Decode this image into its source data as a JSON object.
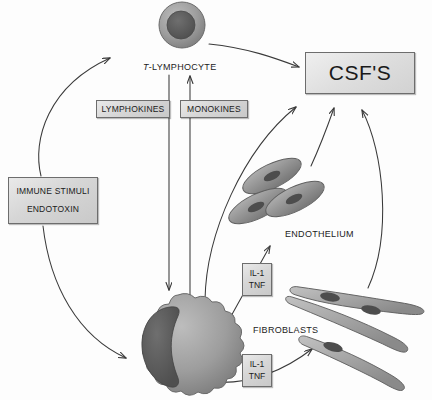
{
  "diagram": {
    "background_color": "#fdfdfd",
    "stroke_color": "#3a3a3a",
    "box_fill": "#d8d8d8",
    "box_border": "#6d6d6d",
    "cell_fill": "#9a9a9a",
    "nucleus_fill": "#5e5e5e"
  },
  "boxes": {
    "csf": "CSF'S",
    "lymphokines": "LYMPHOKINES",
    "monokines": "MONOKINES",
    "stimuli_line1": "IMMUNE STIMULI",
    "stimuli_line2": "ENDOTOXIN",
    "il1_top_line1": "IL-1",
    "il1_top_line2": "TNF",
    "il1_bottom_line1": "IL-1",
    "il1_bottom_line2": "TNF"
  },
  "labels": {
    "t_lymphocyte_prefix": "T",
    "t_lymphocyte_rest": "-LYMPHOCYTE",
    "endothelium": "ENDOTHELIUM",
    "fibroblasts": "FIBROBLASTS"
  },
  "cells": {
    "t_lymphocyte": "round lymphocyte with large nucleus",
    "macrophage": "ruffled macrophage with crescent nucleus",
    "endothelium": "three spindle endothelial cells",
    "fibroblasts": "three elongated fibroblast cells"
  },
  "arrows": [
    {
      "name": "stimuli-to-lymphocyte",
      "from": "IMMUNE STIMULI / ENDOTOXIN",
      "to": "T-LYMPHOCYTE"
    },
    {
      "name": "stimuli-to-macrophage",
      "from": "IMMUNE STIMULI / ENDOTOXIN",
      "to": "MACROPHAGE"
    },
    {
      "name": "lymphocyte-to-csf",
      "from": "T-LYMPHOCYTE",
      "to": "CSF'S"
    },
    {
      "name": "lymphokines-down",
      "from": "T-LYMPHOCYTE",
      "to": "MACROPHAGE"
    },
    {
      "name": "monokines-up",
      "from": "MACROPHAGE",
      "to": "T-LYMPHOCYTE"
    },
    {
      "name": "macrophage-to-csf",
      "from": "MACROPHAGE",
      "to": "CSF'S"
    },
    {
      "name": "macrophage-to-endothelium",
      "from": "MACROPHAGE",
      "to": "ENDOTHELIUM"
    },
    {
      "name": "macrophage-to-fibroblasts",
      "from": "MACROPHAGE",
      "to": "FIBROBLASTS"
    },
    {
      "name": "endothelium-to-csf",
      "from": "ENDOTHELIUM",
      "to": "CSF'S"
    },
    {
      "name": "fibroblasts-to-csf",
      "from": "FIBROBLASTS",
      "to": "CSF'S"
    }
  ]
}
